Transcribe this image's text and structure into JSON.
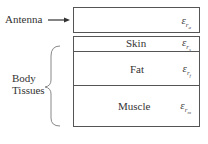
{
  "antenna": {
    "label": "Antenna",
    "symbol": "ε",
    "sub": "r",
    "subsub": "a"
  },
  "body_tissues": {
    "label_line1": "Body",
    "label_line2": "Tissues"
  },
  "layers": [
    {
      "name": "Skin",
      "symbol": "ε",
      "sub": "r",
      "subsub": "s"
    },
    {
      "name": "Fat",
      "symbol": "ε",
      "sub": "r",
      "subsub": "f"
    },
    {
      "name": "Muscle",
      "symbol": "ε",
      "sub": "r",
      "subsub": "m"
    }
  ]
}
